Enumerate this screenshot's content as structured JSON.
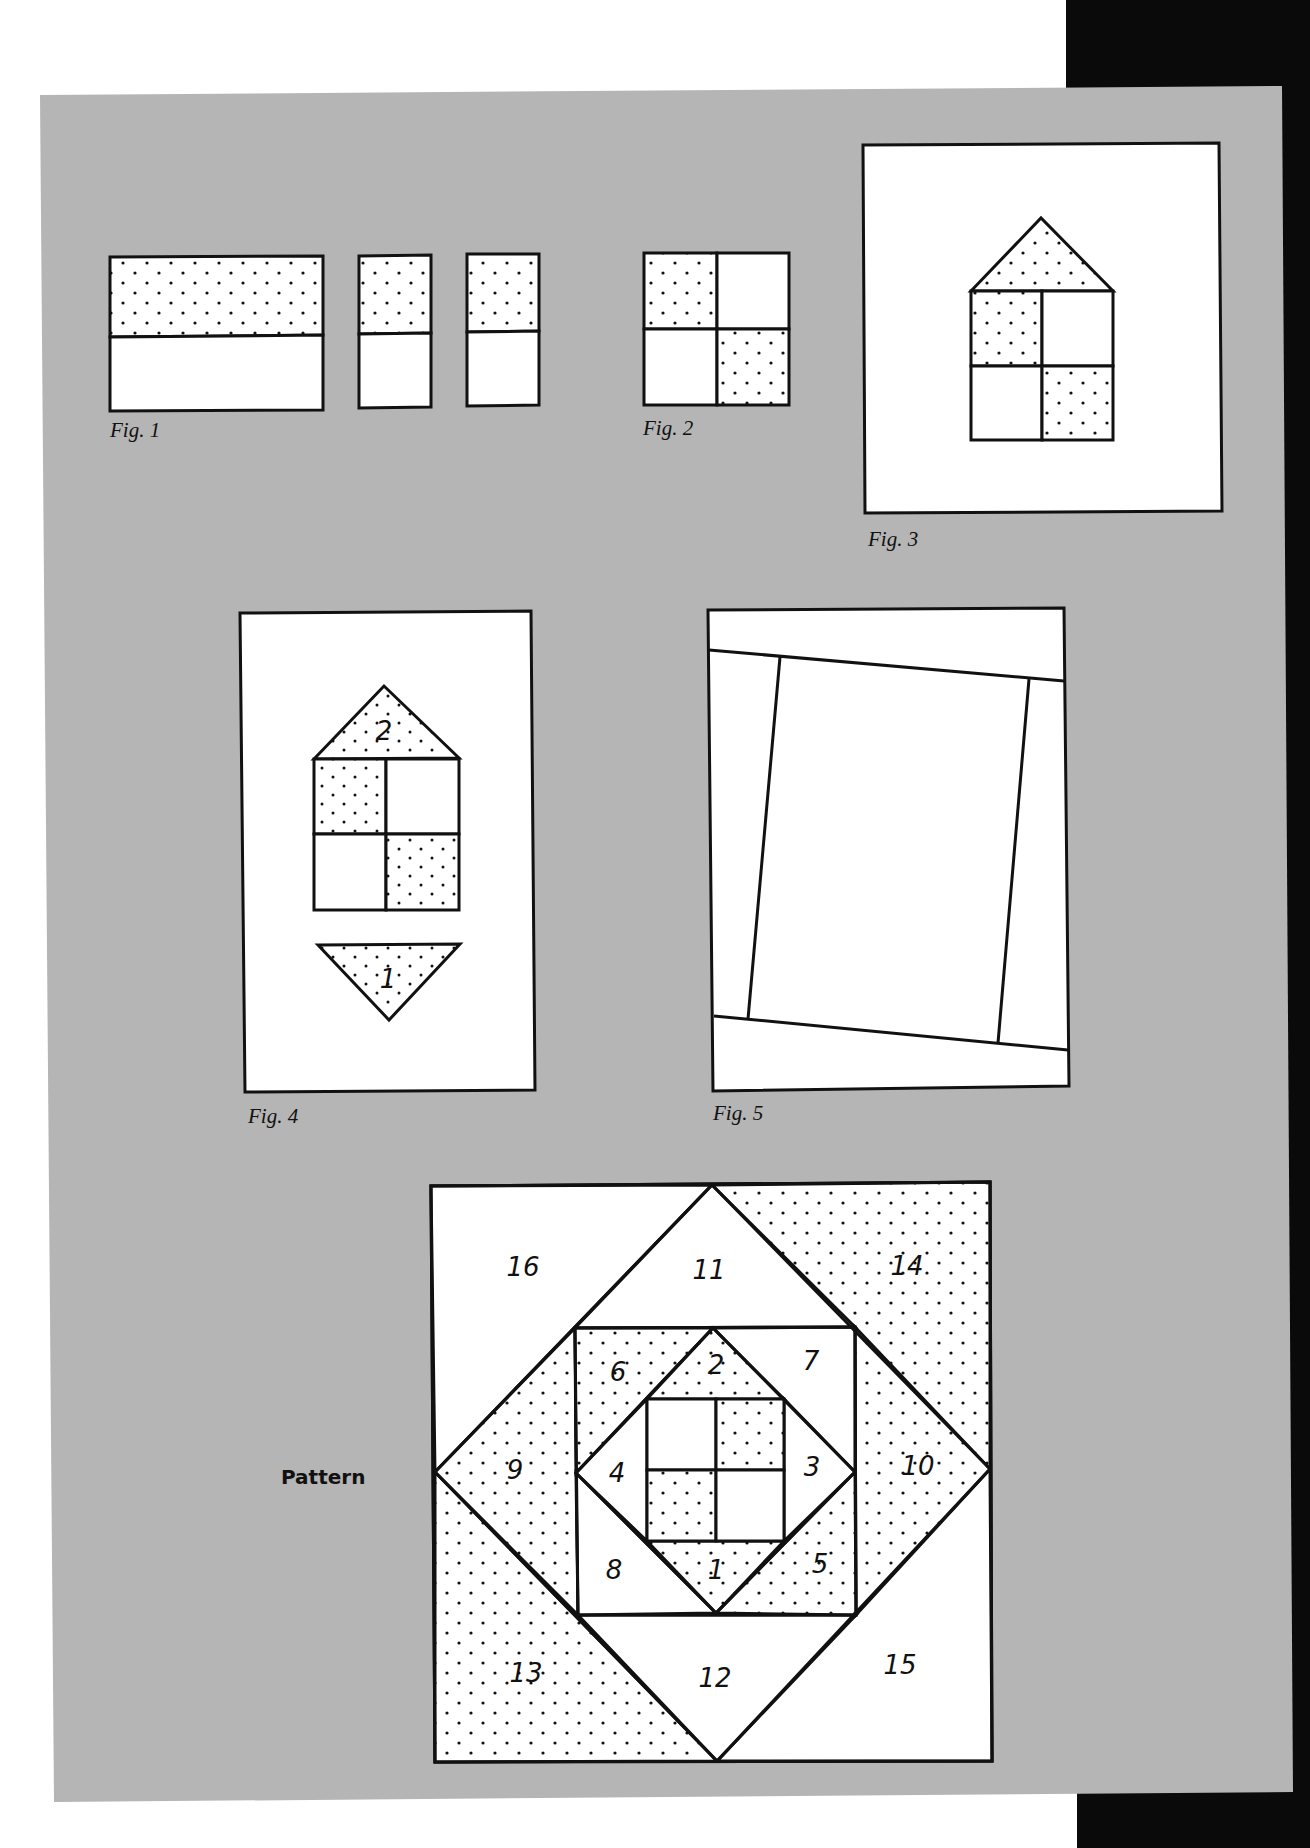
{
  "colors": {
    "page_background": "#ffffff",
    "plate_gray": "#b5b5b5",
    "edge_black": "#0a0a0a",
    "line": "#111111",
    "fabric_white": "#ffffff",
    "dot": "#111111"
  },
  "figures": {
    "fig1": {
      "label": "Fig. 1",
      "description": "Strip of dotted fabric sewn to white strip, cut into two segments"
    },
    "fig2": {
      "label": "Fig. 2",
      "description": "Four-patch with dotted top-left and bottom-right squares"
    },
    "fig3": {
      "label": "Fig. 3",
      "description": "Four-patch with dotted roof triangle centered on white background"
    },
    "fig4": {
      "label": "Fig. 4",
      "description": "Four-patch with roof triangle 2 and inverted triangle 1",
      "piece_labels": [
        "2",
        "1"
      ]
    },
    "fig5": {
      "label": "Fig. 5",
      "description": "Tilted frame strips around center rectangle"
    }
  },
  "pattern": {
    "label": "Pattern",
    "pieces": [
      {
        "id": "1",
        "shaded": true
      },
      {
        "id": "2",
        "shaded": true
      },
      {
        "id": "3",
        "shaded": false
      },
      {
        "id": "4",
        "shaded": false
      },
      {
        "id": "5",
        "shaded": true
      },
      {
        "id": "6",
        "shaded": true
      },
      {
        "id": "7",
        "shaded": false
      },
      {
        "id": "8",
        "shaded": false
      },
      {
        "id": "9",
        "shaded": true
      },
      {
        "id": "10",
        "shaded": true
      },
      {
        "id": "11",
        "shaded": false
      },
      {
        "id": "12",
        "shaded": false
      },
      {
        "id": "13",
        "shaded": true
      },
      {
        "id": "14",
        "shaded": true
      },
      {
        "id": "15",
        "shaded": false
      },
      {
        "id": "16",
        "shaded": false
      }
    ],
    "center_four_patch": {
      "shaded_cells": [
        "top-right",
        "bottom-left"
      ]
    }
  }
}
